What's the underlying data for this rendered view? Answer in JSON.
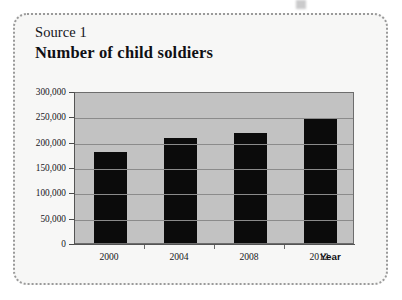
{
  "card": {
    "source_label": "Source 1",
    "title": "Number of child soldiers"
  },
  "chart_data": {
    "type": "bar",
    "title": "Number of child soldiers",
    "xlabel": "Year",
    "ylabel": "",
    "categories": [
      "2000",
      "2004",
      "2008",
      "2012"
    ],
    "values": [
      180000,
      208000,
      218000,
      247000
    ],
    "ylim": [
      0,
      300000
    ],
    "ytick_labels": [
      "0",
      "50,000",
      "100,000",
      "150,000",
      "200,000",
      "250,000",
      "300,000"
    ],
    "ytick_values": [
      0,
      50000,
      100000,
      150000,
      200000,
      250000,
      300000
    ],
    "grid": true,
    "legend": "none",
    "bar_color": "#0b0b0b",
    "plot_background": "#c2c2c2"
  }
}
